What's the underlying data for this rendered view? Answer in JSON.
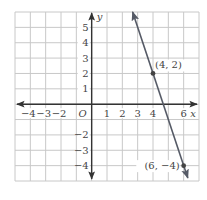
{
  "chart_data": {
    "type": "line",
    "title": "",
    "xlabel": "x",
    "ylabel": "y",
    "origin_label": "O",
    "xlim": [
      -5,
      7
    ],
    "ylim": [
      -5,
      6
    ],
    "grid": true,
    "x_ticks": [
      -4,
      -3,
      -2,
      1,
      2,
      3,
      4,
      6
    ],
    "x_tick_labels": [
      "−4",
      "−3",
      "−2",
      "1",
      "2",
      "3",
      "4",
      "6"
    ],
    "y_ticks": [
      5,
      4,
      3,
      2,
      1,
      -2,
      -3,
      -4
    ],
    "y_tick_labels": [
      "5",
      "4",
      "3",
      "2",
      "1",
      "−2",
      "−3",
      "−4"
    ],
    "series": [
      {
        "name": "line through (4, 2) and (6, -4)",
        "slope": -3,
        "intercept": 14,
        "x": [
          2.67,
          6.27
        ],
        "y": [
          6,
          -4.8
        ],
        "arrows": "both"
      }
    ],
    "points": [
      {
        "x": 4,
        "y": 2,
        "label": "(4, 2)"
      },
      {
        "x": 6,
        "y": -4,
        "label": "(6, −4)"
      }
    ],
    "colors": {
      "grid": "#c8c8c8",
      "axis": "#333333",
      "line": "#555a66",
      "point": "#444444",
      "text": "#444444"
    }
  }
}
